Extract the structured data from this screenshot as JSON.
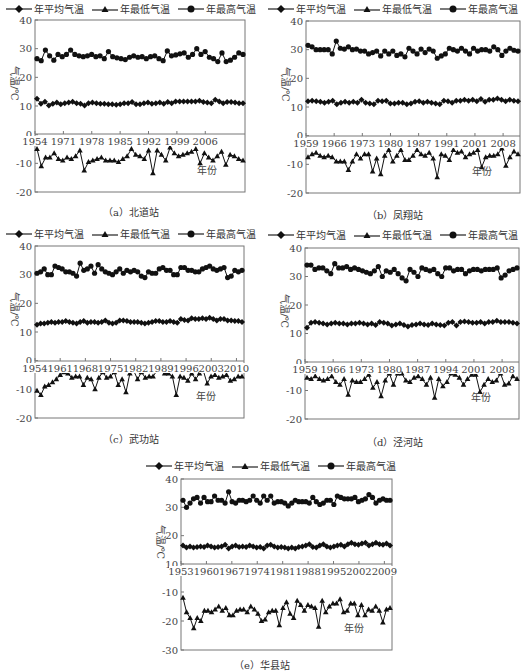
{
  "legend": {
    "mean_label": "年平均气温",
    "min_label": "年最低气温",
    "max_label": "年最高气温"
  },
  "chart_data": [
    {
      "id": "a",
      "type": "line",
      "title": "（a）北道站",
      "ylabel": "气温/℃",
      "xlabel": "年份",
      "ylim": [
        -20,
        40
      ],
      "yticks": [
        40,
        30,
        20,
        10,
        0,
        -10,
        -20
      ],
      "xtick_labels": [
        "1954",
        "1971",
        "1978",
        "1985",
        "1992",
        "1999",
        "2006"
      ],
      "start_year": 1954,
      "series": [
        {
          "name": "年平均气温",
          "marker": "diamond",
          "values": [
            12.5,
            10.8,
            11.5,
            10.2,
            10.8,
            11.2,
            10.6,
            11.0,
            11.2,
            11.5,
            11.0,
            10.8,
            10.2,
            11.0,
            11.2,
            11.0,
            10.8,
            10.8,
            10.6,
            10.6,
            10.4,
            10.6,
            11.0,
            11.0,
            11.4,
            10.6,
            10.6,
            11.0,
            11.2,
            10.8,
            11.0,
            11.2,
            10.8,
            11.4,
            11.0,
            11.6,
            11.6,
            11.6,
            11.6,
            11.6,
            11.6,
            11.8,
            11.4,
            11.2,
            11.0,
            12.2,
            11.6,
            11.0,
            11.4,
            11.4,
            11.2,
            11.0,
            11.0
          ]
        },
        {
          "name": "年最低气温",
          "marker": "triangle",
          "values": [
            -5.0,
            -11.0,
            -8.0,
            -8.0,
            -6.5,
            -8.5,
            -9.0,
            -8.0,
            -8.5,
            -7.5,
            -5.5,
            -12.5,
            -9.5,
            -9.0,
            -8.5,
            -8.0,
            -9.0,
            -9.0,
            -9.0,
            -9.5,
            -8.5,
            -7.5,
            -5.0,
            -7.0,
            -7.5,
            -8.5,
            -5.5,
            -13.5,
            -5.5,
            -7.0,
            -9.0,
            -4.5,
            -6.5,
            -7.5,
            -7.0,
            -6.5,
            -6.0,
            -5.0,
            -10.0,
            -6.5,
            -8.0,
            -9.0,
            -7.5,
            -6.0,
            -10.5,
            -7.0,
            -7.5,
            -8.5,
            -9.0
          ]
        },
        {
          "name": "年最高气温",
          "marker": "circle",
          "values": [
            26.5,
            25.8,
            29.5,
            27.5,
            26.0,
            28.0,
            27.2,
            28.0,
            29.5,
            28.0,
            27.5,
            27.2,
            27.5,
            28.0,
            27.2,
            27.5,
            26.5,
            29.0,
            27.2,
            26.8,
            26.5,
            26.2,
            27.0,
            27.5,
            27.0,
            27.2,
            26.5,
            27.2,
            27.5,
            26.5,
            25.8,
            29.2,
            27.5,
            27.8,
            28.2,
            28.5,
            27.0,
            28.0,
            30.0,
            28.0,
            29.0,
            27.0,
            26.5,
            25.5,
            28.5,
            25.5,
            26.0,
            27.0,
            28.5,
            28.0
          ]
        }
      ]
    },
    {
      "id": "b",
      "type": "line",
      "title": "（b）凤翔站",
      "ylabel": "气温/℃",
      "xlabel": "年份",
      "ylim": [
        -20,
        40
      ],
      "yticks": [
        40,
        30,
        20,
        10,
        0,
        -10,
        -20
      ],
      "xtick_labels": [
        "1959",
        "1966",
        "1973",
        "1980",
        "1987",
        "1991",
        "2001",
        "2008"
      ],
      "start_year": 1959,
      "series": [
        {
          "name": "年平均气温",
          "marker": "diamond",
          "values": [
            12.0,
            12.2,
            12.0,
            11.8,
            11.5,
            11.8,
            12.2,
            11.0,
            11.5,
            11.8,
            11.5,
            11.8,
            11.5,
            12.5,
            11.5,
            11.2,
            11.0,
            12.2,
            12.0,
            12.2,
            11.2,
            11.2,
            11.5,
            11.5,
            11.0,
            11.2,
            11.8,
            12.0,
            11.5,
            11.8,
            11.5,
            11.2,
            11.0,
            12.2,
            12.0,
            11.5,
            12.2,
            12.2,
            12.5,
            12.2,
            12.5,
            12.0,
            12.8,
            11.8,
            12.5,
            12.5,
            13.0,
            12.5,
            12.0,
            12.5,
            12.2,
            12.0
          ]
        },
        {
          "name": "年最低气温",
          "marker": "triangle",
          "values": [
            -7.5,
            -6.5,
            -6.0,
            -7.0,
            -7.5,
            -7.0,
            -7.5,
            -9.0,
            -9.0,
            -9.0,
            -12.0,
            -9.0,
            -6.5,
            -8.0,
            -6.5,
            -6.5,
            -12.5,
            -8.0,
            -13.5,
            -7.0,
            -5.0,
            -9.0,
            -7.0,
            -5.0,
            -8.5,
            -8.5,
            -7.0,
            -5.0,
            -6.5,
            -7.0,
            -6.0,
            -8.0,
            -14.5,
            -6.5,
            -7.0,
            -8.5,
            -5.0,
            -6.0,
            -5.5,
            -7.5,
            -6.5,
            -6.0,
            -5.0,
            -11.0,
            -7.5,
            -7.0,
            -7.0,
            -6.5,
            -4.5,
            -10.5,
            -7.5,
            -5.5,
            -6.5
          ]
        },
        {
          "name": "年最高气温",
          "marker": "circle",
          "values": [
            31.5,
            31.0,
            30.0,
            30.0,
            30.0,
            30.0,
            28.5,
            33.0,
            30.5,
            30.2,
            31.0,
            30.0,
            30.2,
            29.5,
            29.5,
            28.5,
            29.0,
            29.5,
            27.8,
            29.5,
            28.5,
            29.5,
            28.0,
            28.5,
            27.5,
            30.5,
            29.5,
            28.5,
            30.2,
            29.0,
            30.2,
            29.5,
            27.0,
            27.8,
            28.5,
            30.5,
            30.0,
            29.5,
            30.5,
            29.5,
            28.5,
            30.5,
            29.5,
            30.0,
            30.0,
            29.5,
            31.0,
            30.0,
            28.0,
            29.5,
            30.5,
            29.8,
            29.5
          ]
        }
      ]
    },
    {
      "id": "c",
      "type": "line",
      "title": "（c）武功站",
      "ylabel": "气温/℃",
      "xlabel": "年份",
      "ylim": [
        -20,
        40
      ],
      "yticks": [
        40,
        30,
        20,
        10,
        0,
        -10,
        -20
      ],
      "xtick_labels": [
        "1954",
        "1961",
        "1968",
        "1975",
        "1982",
        "1989",
        "1996",
        "2003",
        "2010"
      ],
      "start_year": 1954,
      "series": [
        {
          "name": "年平均气温",
          "marker": "diamond",
          "values": [
            12.5,
            13.0,
            13.0,
            13.2,
            13.5,
            13.2,
            13.5,
            13.5,
            13.8,
            13.5,
            13.2,
            13.0,
            13.5,
            13.8,
            13.2,
            13.5,
            13.5,
            13.2,
            13.5,
            14.0,
            13.2,
            13.0,
            13.2,
            14.0,
            14.0,
            13.8,
            13.5,
            13.5,
            13.5,
            13.2,
            13.0,
            13.2,
            13.5,
            13.8,
            13.8,
            13.5,
            13.5,
            13.8,
            13.5,
            13.2,
            14.5,
            14.2,
            14.0,
            14.8,
            14.5,
            14.5,
            14.8,
            14.5,
            15.0,
            14.5,
            14.0,
            14.5,
            14.5,
            14.0,
            14.0,
            13.8,
            13.8,
            13.5
          ]
        },
        {
          "name": "年最低气温",
          "marker": "triangle",
          "values": [
            -10.5,
            -12.0,
            -9.0,
            -8.5,
            -7.5,
            -6.5,
            -5.0,
            -4.0,
            -4.5,
            -6.0,
            -5.5,
            -5.5,
            -8.5,
            -6.0,
            -6.5,
            -10.0,
            -6.0,
            -4.0,
            -6.0,
            -5.5,
            -4.0,
            -8.5,
            -6.5,
            -11.0,
            -4.5,
            -3.5,
            -6.5,
            -4.0,
            -6.0,
            -5.5,
            -5.5,
            -3.5,
            -3.0,
            -4.5,
            -4.5,
            -5.5,
            -12.0,
            -5.5,
            -6.0,
            -7.0,
            -4.5,
            -6.5,
            -4.5,
            -3.5,
            -8.0,
            -5.5,
            -5.0,
            -6.0,
            -5.5,
            -5.0,
            -7.0,
            -6.5,
            -5.5,
            -5.5
          ]
        },
        {
          "name": "年最高气温",
          "marker": "circle",
          "values": [
            30.5,
            31.0,
            32.0,
            30.0,
            30.0,
            33.0,
            32.5,
            32.0,
            31.0,
            31.0,
            30.5,
            29.5,
            34.0,
            31.5,
            32.0,
            33.0,
            30.5,
            33.5,
            32.0,
            31.0,
            30.5,
            30.0,
            31.0,
            32.0,
            30.5,
            31.5,
            31.0,
            31.5,
            31.0,
            29.5,
            29.0,
            31.0,
            30.5,
            30.5,
            32.0,
            32.5,
            31.5,
            31.5,
            30.0,
            30.0,
            32.5,
            32.5,
            31.5,
            31.5,
            31.0,
            31.0,
            32.0,
            32.5,
            33.0,
            32.0,
            31.5,
            32.0,
            32.5,
            29.0,
            29.5,
            31.5,
            31.0,
            31.5
          ]
        }
      ]
    },
    {
      "id": "d",
      "type": "line",
      "title": "（d）泾河站",
      "ylabel": "气温/℃",
      "xlabel": "年份",
      "ylim": [
        -20,
        40
      ],
      "yticks": [
        40,
        30,
        20,
        10,
        0,
        -10,
        -20
      ],
      "xtick_labels": [
        "1959",
        "1966",
        "1973",
        "1980",
        "1987",
        "1994",
        "2001",
        "2008"
      ],
      "start_year": 1959,
      "series": [
        {
          "name": "年平均气温",
          "marker": "diamond",
          "values": [
            12.0,
            13.8,
            14.0,
            13.8,
            13.5,
            13.2,
            13.5,
            13.8,
            13.5,
            13.5,
            13.2,
            13.5,
            13.5,
            13.8,
            13.5,
            13.2,
            13.5,
            13.0,
            14.0,
            13.8,
            13.5,
            12.8,
            13.2,
            13.5,
            13.0,
            12.5,
            13.0,
            13.2,
            13.5,
            13.2,
            13.0,
            13.5,
            13.2,
            13.0,
            12.8,
            13.8,
            14.0,
            12.8,
            14.0,
            14.2,
            14.0,
            13.8,
            13.8,
            14.0,
            13.5,
            14.0,
            14.0,
            14.5,
            14.0,
            14.0,
            14.0,
            13.8,
            13.5
          ]
        },
        {
          "name": "年最低气温",
          "marker": "triangle",
          "values": [
            -5.5,
            -6.0,
            -5.0,
            -6.0,
            -6.5,
            -6.0,
            -5.0,
            -7.0,
            -8.0,
            -6.0,
            -11.5,
            -6.5,
            -7.0,
            -7.0,
            -6.0,
            -4.5,
            -9.0,
            -7.0,
            -12.0,
            -6.5,
            -4.0,
            -8.0,
            -4.0,
            -4.0,
            -6.5,
            -7.0,
            -5.5,
            -5.0,
            -6.0,
            -8.0,
            -5.5,
            -12.5,
            -6.0,
            -8.5,
            -7.0,
            -4.0,
            -4.5,
            -5.5,
            -8.0,
            -6.0,
            -4.5,
            -4.5,
            -10.5,
            -8.0,
            -6.0,
            -7.0,
            -6.5,
            -4.0,
            -8.0,
            -7.5,
            -5.0,
            -6.0
          ]
        },
        {
          "name": "年最高气温",
          "marker": "circle",
          "values": [
            34.0,
            34.0,
            32.5,
            33.0,
            33.0,
            32.0,
            31.0,
            34.5,
            33.0,
            33.0,
            33.5,
            32.5,
            33.0,
            32.5,
            32.0,
            31.5,
            31.0,
            32.0,
            33.5,
            30.0,
            32.0,
            31.5,
            32.5,
            31.0,
            29.5,
            28.5,
            32.5,
            31.5,
            30.0,
            33.0,
            32.5,
            32.0,
            32.5,
            31.0,
            30.0,
            33.0,
            33.0,
            32.0,
            32.5,
            32.5,
            31.0,
            32.0,
            32.5,
            32.5,
            32.0,
            32.5,
            32.5,
            32.5,
            33.0,
            29.5,
            30.5,
            32.0,
            32.5,
            33.0
          ]
        }
      ]
    },
    {
      "id": "e",
      "type": "line",
      "title": "（e）华县站",
      "ylabel": "气温/℃",
      "xlabel": "年份",
      "ylim": [
        -30,
        40
      ],
      "axis_break": [
        -10,
        10
      ],
      "yticks": [
        40,
        30,
        20,
        10,
        -10,
        -20,
        -30
      ],
      "xtick_labels": [
        "1953",
        "1960",
        "1967",
        "1974",
        "1981",
        "1988",
        "1995",
        "2002",
        "2009"
      ],
      "start_year": 1953,
      "series": [
        {
          "name": "年平均气温",
          "marker": "diamond",
          "values": [
            16.5,
            15.8,
            16.2,
            15.8,
            16.0,
            16.2,
            16.0,
            16.5,
            16.2,
            15.8,
            16.0,
            16.2,
            16.8,
            15.5,
            16.2,
            16.5,
            16.0,
            16.2,
            16.0,
            16.5,
            16.2,
            15.8,
            16.0,
            15.5,
            16.5,
            16.8,
            16.2,
            15.8,
            16.0,
            15.8,
            15.5,
            15.8,
            15.5,
            16.0,
            16.2,
            16.5,
            17.0,
            16.0,
            15.8,
            16.5,
            17.0,
            16.2,
            15.8,
            16.2,
            16.5,
            16.8,
            16.2,
            17.0,
            17.5,
            17.0,
            16.8,
            17.2,
            17.5,
            16.5,
            17.0,
            17.5,
            17.0,
            16.8,
            17.2,
            16.5
          ]
        },
        {
          "name": "年最低气温",
          "marker": "triangle",
          "values": [
            -12.0,
            -17.0,
            -19.0,
            -22.5,
            -19.0,
            -20.0,
            -16.5,
            -16.5,
            -17.0,
            -16.0,
            -15.0,
            -16.5,
            -15.5,
            -18.0,
            -18.0,
            -16.5,
            -16.0,
            -16.0,
            -17.0,
            -15.0,
            -16.0,
            -17.5,
            -20.0,
            -19.5,
            -17.0,
            -16.5,
            -16.5,
            -21.5,
            -15.5,
            -13.5,
            -17.5,
            -19.0,
            -13.0,
            -14.5,
            -16.5,
            -14.5,
            -15.0,
            -15.5,
            -22.0,
            -13.0,
            -17.0,
            -15.0,
            -14.0,
            -14.0,
            -12.5,
            -17.0,
            -16.5,
            -14.0,
            -14.0,
            -18.0,
            -14.5,
            -18.0,
            -16.0,
            -16.5,
            -15.0,
            -16.5,
            -20.5,
            -16.0,
            -15.5
          ]
        },
        {
          "name": "年最高气温",
          "marker": "circle",
          "values": [
            32.5,
            30.0,
            31.5,
            33.0,
            33.5,
            31.5,
            33.5,
            32.0,
            32.0,
            34.0,
            32.5,
            32.5,
            31.5,
            35.5,
            32.0,
            31.5,
            32.5,
            32.5,
            32.0,
            32.5,
            34.0,
            32.5,
            31.5,
            34.0,
            32.5,
            34.0,
            31.5,
            32.0,
            32.0,
            31.5,
            30.5,
            31.5,
            32.5,
            32.0,
            32.0,
            32.0,
            31.5,
            33.5,
            32.0,
            31.0,
            31.5,
            32.5,
            32.5,
            31.0,
            34.0,
            33.5,
            33.0,
            33.0,
            33.0,
            33.5,
            32.0,
            32.5,
            33.0,
            34.5,
            33.5,
            31.5,
            32.5,
            33.0,
            32.5,
            32.5
          ]
        }
      ]
    }
  ]
}
